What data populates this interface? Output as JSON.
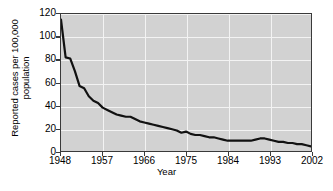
{
  "chart_data": {
    "type": "line",
    "title": "",
    "xlabel": "Year",
    "ylabel": "Reported cases per 100,000\npopulation",
    "xlim": [
      1948,
      2002
    ],
    "ylim": [
      0,
      120
    ],
    "grid": true,
    "legend": false,
    "y_ticks": [
      0,
      20,
      40,
      60,
      80,
      100,
      120
    ],
    "y_tick_labels": [
      "0",
      "20",
      "40",
      "60",
      "80",
      "100",
      "120"
    ],
    "x_ticks": [
      1948,
      1957,
      1966,
      1975,
      1984,
      1993,
      2002
    ],
    "x_tick_labels": [
      "1948",
      "1957",
      "1966",
      "1975",
      "1984",
      "1993",
      "2002"
    ],
    "series": [
      {
        "name": "Reported cases per 100,000 population",
        "color": "#111111",
        "x": [
          1948,
          1949,
          1950,
          1951,
          1952,
          1953,
          1954,
          1955,
          1956,
          1957,
          1958,
          1959,
          1960,
          1961,
          1962,
          1963,
          1964,
          1965,
          1966,
          1967,
          1968,
          1969,
          1970,
          1971,
          1972,
          1973,
          1974,
          1975,
          1976,
          1977,
          1978,
          1979,
          1980,
          1981,
          1982,
          1983,
          1984,
          1985,
          1986,
          1987,
          1988,
          1989,
          1990,
          1991,
          1992,
          1993,
          1994,
          1995,
          1996,
          1997,
          1998,
          1999,
          2000,
          2001,
          2002
        ],
        "values": [
          115,
          82,
          81,
          70,
          57,
          55,
          48,
          44,
          42,
          38,
          36,
          34,
          32,
          31,
          30,
          30,
          28,
          26,
          25,
          24,
          23,
          22,
          21,
          20,
          19,
          18,
          16,
          17,
          15,
          14,
          14,
          13,
          12,
          12,
          11,
          10,
          9,
          9,
          9,
          9,
          9,
          9,
          10,
          11,
          11,
          10,
          9,
          8,
          8,
          7,
          7,
          6,
          6,
          5,
          4
        ]
      }
    ]
  },
  "axes": {
    "y_title": "Reported cases per 100,000\npopulation",
    "x_title": "Year"
  }
}
